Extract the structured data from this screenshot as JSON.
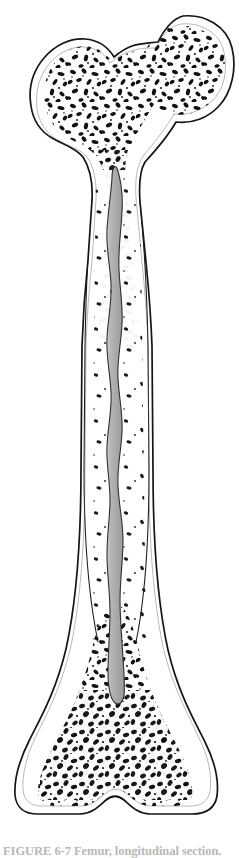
{
  "figure": {
    "title": "Femur, longitudinal section",
    "caption_text": "FIGURE 6-7  Femur, longitudinal section.",
    "view": "longitudinal section",
    "bone_name": "femur",
    "orientation": "proximal at top, distal at bottom",
    "page_width": 239,
    "page_height": 858
  },
  "colors": {
    "background": "#ffffff",
    "outline": "#1a1a1a",
    "cortical_bone": "#ffffff",
    "trabecular_bone": "#111111",
    "medullary_cavity_light": "#c9c9c9",
    "medullary_cavity_mid": "#a9a9a9",
    "medullary_cavity_dark": "#9a9a9a",
    "caption_text": "#7d7d7d"
  },
  "anatomy": {
    "regions": [
      {
        "key": "femoral-head",
        "label": "Head of femur",
        "cx": 188,
        "cy": 68,
        "rx": 47,
        "ry": 48
      },
      {
        "key": "femoral-neck",
        "label": "Neck of femur",
        "cx": 150,
        "cy": 108,
        "rx": 30,
        "ry": 24
      },
      {
        "key": "greater-trochanter",
        "label": "Greater trochanter",
        "cx": 78,
        "cy": 95,
        "rx": 45,
        "ry": 55
      },
      {
        "key": "lesser-trochanter",
        "label": "Lesser trochanter",
        "cx": 66,
        "cy": 178,
        "rx": 18,
        "ry": 22
      },
      {
        "key": "proximal-metaphysis",
        "label": "Proximal metaphysis",
        "cx": 118,
        "cy": 190,
        "rx": 52,
        "ry": 45
      },
      {
        "key": "diaphysis",
        "label": "Diaphysis (shaft)",
        "cx": 116,
        "cy": 430,
        "rx": 38,
        "ry": 200
      },
      {
        "key": "medullary-cavity",
        "label": "Medullary cavity",
        "cx": 116,
        "cy": 420,
        "rx": 10,
        "ry": 240
      },
      {
        "key": "compact-bone",
        "label": "Compact (cortical) bone",
        "cx": 116,
        "cy": 430,
        "rx": 38,
        "ry": 200
      },
      {
        "key": "distal-metaphysis",
        "label": "Distal metaphysis",
        "cx": 120,
        "cy": 700,
        "rx": 75,
        "ry": 60
      },
      {
        "key": "medial-condyle",
        "label": "Medial condyle",
        "cx": 68,
        "cy": 775,
        "rx": 48,
        "ry": 38
      },
      {
        "key": "lateral-condyle",
        "label": "Lateral condyle",
        "cx": 176,
        "cy": 775,
        "rx": 46,
        "ry": 38
      },
      {
        "key": "intercondylar-notch",
        "label": "Intercondylar notch",
        "cx": 120,
        "cy": 812,
        "rx": 22,
        "ry": 10
      }
    ]
  },
  "geometry": {
    "bone_outline": "M 183 16 C 205 14, 227 26, 232 48 C 237 68, 232 92, 219 106 C 208 118, 192 124, 176 122 C 168 136, 156 150, 145 162 C 139 172, 139 188, 140 202 L 146 262 C 149 292, 151 318, 152 346 L 153 470 C 153 540, 157 600, 168 650 C 178 692, 193 718, 205 742 C 215 762, 219 780, 217 796 C 215 808, 206 814, 192 814 L 150 814 C 138 814, 131 806, 124 800 C 118 795, 112 795, 106 800 C 99 806, 92 814, 80 814 L 38 814 C 24 814, 16 807, 15 795 C 14 779, 19 761, 29 741 C 41 717, 56 691, 66 649 C 77 599, 81 539, 81 469 L 82 346 C 83 316, 85 288, 88 260 L 92 200 C 93 182, 90 168, 83 157 C 75 147, 62 144, 52 138 C 40 131, 33 120, 31 106 C 28 88, 33 71, 44 58 C 55 45, 70 38, 85 39 C 98 40, 108 47, 114 57 C 120 52, 126 48, 132 46 C 141 43, 150 43, 158 42 C 164 30, 172 19, 183 16 Z",
    "medullary_cavity": "M 117 168 C 121 180, 123 196, 122 212 C 121 232, 118 250, 119 270 C 120 290, 123 306, 122 324 C 121 344, 117 360, 118 378 C 119 398, 123 414, 122 432 C 121 452, 117 468, 118 486 C 119 506, 123 522, 123 540 C 123 560, 120 580, 120 600 C 120 620, 122 640, 123 658 C 124 674, 125 686, 124 696 C 122 704, 118 706, 114 702 C 110 697, 108 686, 108 672 C 108 652, 110 632, 110 612 C 110 592, 107 574, 107 554 C 107 534, 110 518, 110 500 C 110 480, 106 464, 107 446 C 108 426, 112 410, 111 392 C 110 372, 106 356, 107 338 C 108 318, 112 302, 111 284 C 110 264, 106 248, 107 230 C 108 212, 111 194, 112 178 C 112 170, 114 164, 117 168 Z",
    "cortical_inner_left": "M 92 198 C 88 240, 86 290, 85 346 L 84 470 C 84 536, 88 594, 98 642",
    "cortical_inner_right": "M 140 200 C 144 242, 147 292, 148 346 L 149 470 C 149 536, 146 594, 136 642"
  },
  "notes": {
    "style": "black-and-white anatomical line drawing, stippled trabecular pattern",
    "caption_clipped": "caption is cropped by the bottom edge of the image; only glyph tops visible"
  }
}
